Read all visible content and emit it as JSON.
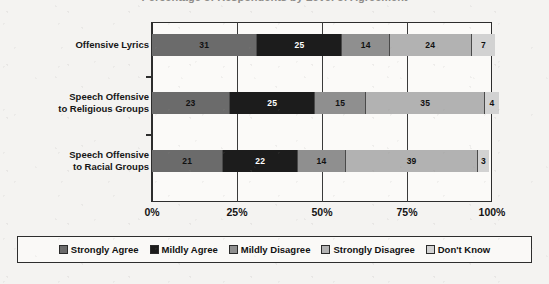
{
  "title_sliver": "Percentage of Respondents by Level of Agreement",
  "chart_data": {
    "type": "bar",
    "subtype": "stacked-horizontal-100pct",
    "title": "",
    "xlabel": "",
    "ylabel": "",
    "xlim": [
      0,
      100
    ],
    "xticks": [
      "0%",
      "25%",
      "50%",
      "75%",
      "100%"
    ],
    "xtick_values": [
      0,
      25,
      50,
      75,
      100
    ],
    "grid": true,
    "legend_position": "bottom",
    "categories": [
      "Offensive Lyrics",
      "Speech Offensive to Religious Groups",
      "Speech Offensive to Racial Groups"
    ],
    "series": [
      {
        "name": "Strongly Agree",
        "color": "#6b6b6b",
        "text_color": "#111111",
        "values": [
          31,
          23,
          21
        ]
      },
      {
        "name": "Mildly Agree",
        "color": "#1c1c1c",
        "text_color": "#ffffff",
        "values": [
          25,
          25,
          22
        ]
      },
      {
        "name": "Mildly Disagree",
        "color": "#8f8f8f",
        "text_color": "#111111",
        "values": [
          14,
          15,
          14
        ]
      },
      {
        "name": "Strongly Disagree",
        "color": "#b2b2b2",
        "text_color": "#111111",
        "values": [
          24,
          35,
          39
        ]
      },
      {
        "name": "Don't Know",
        "color": "#d2d2d2",
        "text_color": "#111111",
        "values": [
          7,
          4,
          3
        ]
      }
    ]
  },
  "rows": [
    {
      "label_line1": "Offensive Lyrics",
      "label_line2": "",
      "segments": [
        {
          "label": "31",
          "value": 31,
          "color": "#6b6b6b",
          "text_color": "#111111"
        },
        {
          "label": "25",
          "value": 25,
          "color": "#1c1c1c",
          "text_color": "#ffffff"
        },
        {
          "label": "14",
          "value": 14,
          "color": "#8f8f8f",
          "text_color": "#111111"
        },
        {
          "label": "24",
          "value": 24,
          "color": "#b2b2b2",
          "text_color": "#111111"
        },
        {
          "label": "7",
          "value": 7,
          "color": "#d2d2d2",
          "text_color": "#111111"
        }
      ]
    },
    {
      "label_line1": "Speech Offensive",
      "label_line2": "to Religious Groups",
      "segments": [
        {
          "label": "23",
          "value": 23,
          "color": "#6b6b6b",
          "text_color": "#111111"
        },
        {
          "label": "25",
          "value": 25,
          "color": "#1c1c1c",
          "text_color": "#ffffff"
        },
        {
          "label": "15",
          "value": 15,
          "color": "#8f8f8f",
          "text_color": "#111111"
        },
        {
          "label": "35",
          "value": 35,
          "color": "#b2b2b2",
          "text_color": "#111111"
        },
        {
          "label": "4",
          "value": 4,
          "color": "#d2d2d2",
          "text_color": "#111111"
        }
      ]
    },
    {
      "label_line1": "Speech Offensive",
      "label_line2": "to Racial Groups",
      "segments": [
        {
          "label": "21",
          "value": 21,
          "color": "#6b6b6b",
          "text_color": "#111111"
        },
        {
          "label": "22",
          "value": 22,
          "color": "#1c1c1c",
          "text_color": "#ffffff"
        },
        {
          "label": "14",
          "value": 14,
          "color": "#8f8f8f",
          "text_color": "#111111"
        },
        {
          "label": "39",
          "value": 39,
          "color": "#b2b2b2",
          "text_color": "#111111"
        },
        {
          "label": "3",
          "value": 3,
          "color": "#d2d2d2",
          "text_color": "#111111"
        }
      ]
    }
  ],
  "xaxis": {
    "ticks": [
      {
        "label": "0%",
        "pos": 0
      },
      {
        "label": "25%",
        "pos": 25
      },
      {
        "label": "50%",
        "pos": 50
      },
      {
        "label": "75%",
        "pos": 75
      },
      {
        "label": "100%",
        "pos": 100
      }
    ]
  },
  "legend": {
    "items": [
      {
        "label": "Strongly Agree",
        "color": "#6b6b6b"
      },
      {
        "label": "Mildly Agree",
        "color": "#1c1c1c"
      },
      {
        "label": "Mildly Disagree",
        "color": "#8f8f8f"
      },
      {
        "label": "Strongly Disagree",
        "color": "#b2b2b2"
      },
      {
        "label": "Don't Know",
        "color": "#d2d2d2"
      }
    ]
  }
}
